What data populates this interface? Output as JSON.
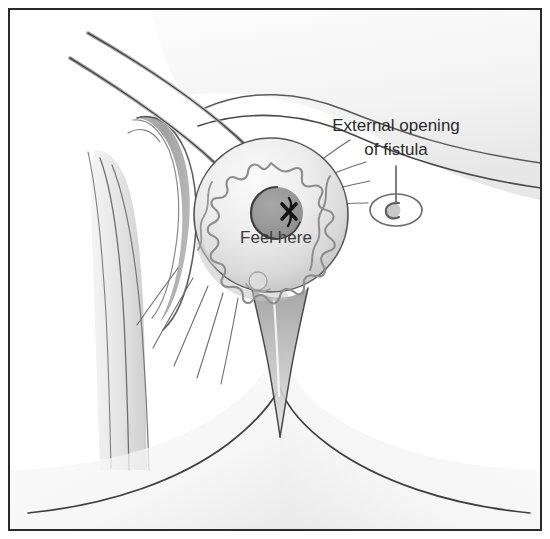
{
  "figure": {
    "type": "medical-line-illustration",
    "background_color": "#ffffff",
    "frame": {
      "name": "illustration-border",
      "color": "#2a2a2a",
      "stroke_width": 2,
      "inset_px": 8
    }
  },
  "labels": {
    "callout": {
      "line1": "External opening",
      "line2": "of fistula",
      "color": "#2b2b2b",
      "x": 396,
      "y1": 131,
      "y2": 155,
      "leader_line": {
        "name": "callout-leader-line",
        "x": 396,
        "y_top": 166,
        "y_bottom": 208,
        "color": "#555555"
      }
    },
    "inline": {
      "text": "Feel here",
      "color": "#3a3a3a",
      "x": 276,
      "y": 243
    }
  },
  "markers": {
    "fistula_opening": {
      "name": "fistula-opening-marker",
      "cx": 396,
      "cy": 210,
      "rx": 26,
      "ry": 16,
      "inner_glyph": "c-shape",
      "outline_color": "#6e6e6e"
    },
    "probe_x_mark": {
      "name": "probe-x-mark",
      "cx": 289,
      "cy": 211,
      "size": 13,
      "color": "#1a1a1a"
    },
    "anal_canal": {
      "name": "anal-canal-center",
      "cx": 277,
      "cy": 213,
      "r": 26,
      "fill_color": "#9a9a9a"
    }
  },
  "anatomy": {
    "perineal_mound": {
      "name": "perineal-mound",
      "cx": 271,
      "cy": 215,
      "r": 77,
      "fill_top": "#f2f2f2",
      "fill_bottom": "#cdcdcd",
      "outline_color": "#5a5a5a"
    },
    "sphincter_rugae": {
      "name": "sphincter-rugae-outline",
      "color": "#8d8d8d",
      "points": 11,
      "outer_r": 52,
      "inner_r": 38
    },
    "labial_fold_band": {
      "name": "labial-fold-band",
      "color": "#a6a6a6",
      "shadow_color": "#8f8f8f"
    },
    "radiating_creases": {
      "name": "radiating-skin-creases",
      "color": "#707070",
      "upper_right_count": 4,
      "lower_left_count": 5
    },
    "gluteal_cleft": {
      "name": "gluteal-cleft",
      "color": "#4a4a4a"
    },
    "buttock_curves": {
      "name": "buttock-contour-curves",
      "color": "#444444",
      "count": 2
    },
    "upper_instruments": {
      "name": "tissue-fold-edges",
      "color": "#4d4d4d",
      "count": 2
    }
  },
  "palette": {
    "ink_dark": "#2a2a2a",
    "ink_mid": "#5a5a5a",
    "ink_light": "#8d8d8d",
    "tissue_light": "#f4f4f4",
    "tissue_mid": "#d8d8d8",
    "tissue_dark": "#b4b4b4"
  }
}
